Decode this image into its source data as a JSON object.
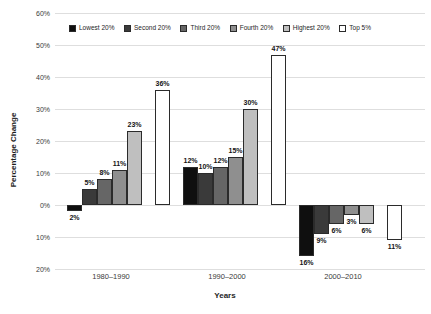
{
  "chart_data": {
    "type": "bar",
    "title": "",
    "xlabel": "Years",
    "ylabel": "Percentage Change",
    "categories": [
      "1980–1990",
      "1990–2000",
      "2000–2010"
    ],
    "series": [
      {
        "name": "Lowest 20%",
        "color": "#0f0f0f",
        "values": [
          -2,
          12,
          -16
        ],
        "labels": [
          "2%",
          "12%",
          "16%"
        ]
      },
      {
        "name": "Second 20%",
        "color": "#3a3a3a",
        "values": [
          5,
          10,
          -9
        ],
        "labels": [
          "5%",
          "10%",
          "9%"
        ]
      },
      {
        "name": "Third 20%",
        "color": "#666666",
        "values": [
          8,
          12,
          -6
        ],
        "labels": [
          "8%",
          "12%",
          "6%"
        ]
      },
      {
        "name": "Fourth 20%",
        "color": "#8f8f8f",
        "values": [
          11,
          15,
          -3
        ],
        "labels": [
          "11%",
          "15%",
          "3%"
        ]
      },
      {
        "name": "Highest 20%",
        "color": "#bfbfbf",
        "values": [
          23,
          30,
          -6
        ],
        "labels": [
          "23%",
          "30%",
          "6%"
        ]
      },
      {
        "name": "Top 5%",
        "color": "#ffffff",
        "values": [
          36,
          47,
          -11
        ],
        "labels": [
          "36%",
          "47%",
          "11%"
        ]
      }
    ],
    "y_ticks": [
      "60%",
      "50%",
      "40%",
      "30%",
      "20%",
      "10%",
      "0%",
      "10%",
      "20%"
    ],
    "ylim": [
      -20,
      60
    ],
    "grid": true,
    "legend_position": "top"
  }
}
